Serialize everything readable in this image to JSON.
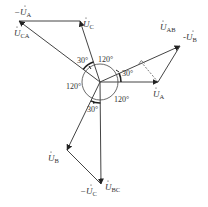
{
  "diagram": {
    "type": "phasor-diagram",
    "origin": {
      "x": 100,
      "y": 82
    },
    "phasors": [
      {
        "id": "UA",
        "label_prefix": "",
        "label_main": "U",
        "label_sub": "A",
        "from": [
          100,
          82
        ],
        "to": [
          158,
          82
        ],
        "style": "solid"
      },
      {
        "id": "minusUB",
        "label_prefix": "-",
        "label_main": "U",
        "label_sub": "B",
        "from": [
          158,
          82
        ],
        "to": [
          180,
          46
        ],
        "style": "solid"
      },
      {
        "id": "UAB",
        "label_prefix": "",
        "label_main": "U",
        "label_sub": "AB",
        "from": [
          100,
          82
        ],
        "to": [
          180,
          46
        ],
        "style": "solid"
      },
      {
        "id": "UC",
        "label_prefix": "",
        "label_main": "U",
        "label_sub": "C",
        "from": [
          100,
          82
        ],
        "to": [
          80,
          21
        ],
        "style": "solid"
      },
      {
        "id": "minusUA",
        "label_prefix": "-",
        "label_main": "U",
        "label_sub": "A",
        "from": [
          80,
          21
        ],
        "to": [
          19,
          21
        ],
        "style": "solid"
      },
      {
        "id": "UCA",
        "label_prefix": "",
        "label_main": "U",
        "label_sub": "CA",
        "from": [
          100,
          82
        ],
        "to": [
          19,
          21
        ],
        "style": "solid"
      },
      {
        "id": "UB",
        "label_prefix": "",
        "label_main": "U",
        "label_sub": "B",
        "from": [
          100,
          82
        ],
        "to": [
          67,
          150
        ],
        "style": "solid"
      },
      {
        "id": "minusUC",
        "label_prefix": "-",
        "label_main": "U",
        "label_sub": "C",
        "from": [
          67,
          150
        ],
        "to": [
          101,
          184
        ],
        "style": "solid"
      },
      {
        "id": "UBC",
        "label_prefix": "",
        "label_main": "U",
        "label_sub": "BC",
        "from": [
          100,
          82
        ],
        "to": [
          101,
          184
        ],
        "style": "solid"
      }
    ],
    "angles": [
      {
        "label": "30°",
        "between": [
          "UA",
          "UAB"
        ]
      },
      {
        "label": "120°",
        "between": [
          "UA",
          "UB"
        ],
        "position": "lower-right"
      },
      {
        "label": "120°",
        "between": [
          "UC",
          "UA"
        ],
        "position": "upper"
      },
      {
        "label": "120°",
        "between": [
          "UB",
          "UC"
        ],
        "position": "left"
      },
      {
        "label": "30°",
        "between": [
          "UC",
          "UCA"
        ]
      },
      {
        "label": "30°",
        "between": [
          "UB",
          "UBC"
        ]
      }
    ],
    "annotations": [
      {
        "type": "perpendicular-dashed-line",
        "from": [
          158,
          82
        ],
        "to": "foot on UAB",
        "right_angle_marker": true
      }
    ],
    "labels": {
      "UA": {
        "prefix": "",
        "main": "U",
        "sub": "A"
      },
      "minusUB": {
        "prefix": "-",
        "main": "U",
        "sub": "B"
      },
      "UAB": {
        "prefix": "",
        "main": "U",
        "sub": "AB"
      },
      "UC": {
        "prefix": "",
        "main": "U",
        "sub": "C"
      },
      "minusUA": {
        "prefix": "−",
        "main": "U",
        "sub": "A"
      },
      "UCA": {
        "prefix": "",
        "main": "U",
        "sub": "CA"
      },
      "UB": {
        "prefix": "",
        "main": "U",
        "sub": "B"
      },
      "minusUC": {
        "prefix": "−",
        "main": "U",
        "sub": "C"
      },
      "UBC": {
        "prefix": "",
        "main": "U",
        "sub": "BC"
      }
    },
    "angle_labels": {
      "a30_right": "30°",
      "a120_top": "120°",
      "a120_right": "120°",
      "a120_left": "120°",
      "a30_top": "30°",
      "a30_bottom": "30°"
    },
    "line_color": "#444444"
  }
}
